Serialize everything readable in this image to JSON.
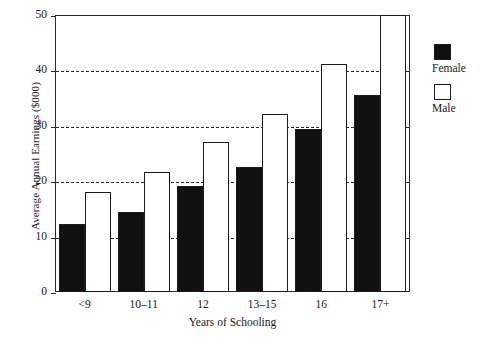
{
  "chart_data": {
    "type": "bar",
    "title": "",
    "subtitle": "",
    "xlabel": "Years of Schooling",
    "ylabel": "Average Annual Earnings ($000)",
    "categories": [
      "<9",
      "10–11",
      "12",
      "13–15",
      "16",
      "17+"
    ],
    "series": [
      {
        "name": "Female",
        "color": "#111111",
        "values": [
          12.3,
          14.4,
          19.2,
          22.5,
          29.5,
          35.5
        ]
      },
      {
        "name": "Male",
        "color": "#ffffff",
        "values": [
          18.0,
          21.7,
          27.0,
          32.2,
          41.2,
          50.0
        ]
      }
    ],
    "ylim": [
      0,
      50
    ],
    "yticks": [
      0,
      10,
      20,
      30,
      40,
      50
    ],
    "ytick_labels": [
      "0",
      "10",
      "20",
      "30",
      "40",
      "50"
    ],
    "grid": "horizontal-dashed",
    "grid_values": [
      10,
      20,
      30,
      40
    ],
    "legend_position": "right"
  },
  "legend": {
    "items": [
      {
        "label": "Female",
        "swatch": "filled-black-square"
      },
      {
        "label": "Male",
        "swatch": "open-white-square"
      }
    ]
  }
}
